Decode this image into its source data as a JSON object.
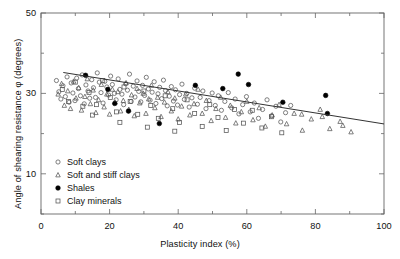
{
  "chart_data": {
    "type": "scatter",
    "title": "",
    "xlabel": "Plasticity index (%)",
    "ylabel": "Angle of shearing resistance φ (degrees)",
    "xlim": [
      0,
      100
    ],
    "ylim": [
      0,
      50
    ],
    "xticks": [
      0,
      20,
      40,
      60,
      80,
      100
    ],
    "yticks": [
      10,
      30,
      50
    ],
    "xminor_step": 10,
    "yminor_step": 10,
    "grid": false,
    "legend_position": "lower-left-inside",
    "series": [
      {
        "name": "Soft clays",
        "marker": "open-circle",
        "color": "#555555",
        "points": [
          [
            4.5,
            33.2
          ],
          [
            5.2,
            30.4
          ],
          [
            5.8,
            28.6
          ],
          [
            6.4,
            31.9
          ],
          [
            7.1,
            29.2
          ],
          [
            7.6,
            34.1
          ],
          [
            8.2,
            27.8
          ],
          [
            8.8,
            32.6
          ],
          [
            9.3,
            30.1
          ],
          [
            9.9,
            28.2
          ],
          [
            10.4,
            33.8
          ],
          [
            10.9,
            31.2
          ],
          [
            11.5,
            29.4
          ],
          [
            12.0,
            34.6
          ],
          [
            12.6,
            27.4
          ],
          [
            13.1,
            32.1
          ],
          [
            13.7,
            30.6
          ],
          [
            14.2,
            28.8
          ],
          [
            14.8,
            33.4
          ],
          [
            15.3,
            31.4
          ],
          [
            15.9,
            29.0
          ],
          [
            16.4,
            35.1
          ],
          [
            17.0,
            32.8
          ],
          [
            17.5,
            30.2
          ],
          [
            18.1,
            27.6
          ],
          [
            18.6,
            33.0
          ],
          [
            19.2,
            31.6
          ],
          [
            19.7,
            29.6
          ],
          [
            20.3,
            34.3
          ],
          [
            20.8,
            32.2
          ],
          [
            21.4,
            30.0
          ],
          [
            21.9,
            28.4
          ],
          [
            22.5,
            33.6
          ],
          [
            23.0,
            31.0
          ],
          [
            23.6,
            29.8
          ],
          [
            24.1,
            27.2
          ],
          [
            24.7,
            32.4
          ],
          [
            25.2,
            30.8
          ],
          [
            25.8,
            34.8
          ],
          [
            26.3,
            28.0
          ],
          [
            26.9,
            31.8
          ],
          [
            27.4,
            29.1
          ],
          [
            28.0,
            33.1
          ],
          [
            28.5,
            30.5
          ],
          [
            29.1,
            27.9
          ],
          [
            29.6,
            32.0
          ],
          [
            30.2,
            29.5
          ],
          [
            30.7,
            34.0
          ],
          [
            31.3,
            31.1
          ],
          [
            31.8,
            28.3
          ],
          [
            32.4,
            30.3
          ],
          [
            33.0,
            32.9
          ],
          [
            33.5,
            27.5
          ],
          [
            34.1,
            29.9
          ],
          [
            34.6,
            31.5
          ],
          [
            35.2,
            28.7
          ],
          [
            35.7,
            33.3
          ],
          [
            36.3,
            30.7
          ],
          [
            36.8,
            26.9
          ],
          [
            37.4,
            29.3
          ],
          [
            38.0,
            31.7
          ],
          [
            38.6,
            28.1
          ],
          [
            39.2,
            30.9
          ],
          [
            39.8,
            27.1
          ],
          [
            40.4,
            29.7
          ],
          [
            41.1,
            32.3
          ],
          [
            41.8,
            28.5
          ],
          [
            42.5,
            30.0
          ],
          [
            43.2,
            26.6
          ],
          [
            44.0,
            28.9
          ],
          [
            44.8,
            31.3
          ],
          [
            45.6,
            27.3
          ],
          [
            46.4,
            29.0
          ],
          [
            47.2,
            30.6
          ],
          [
            48.1,
            26.2
          ],
          [
            49.0,
            28.2
          ],
          [
            49.9,
            30.1
          ],
          [
            50.8,
            27.0
          ],
          [
            51.7,
            29.4
          ],
          [
            52.6,
            25.8
          ],
          [
            53.6,
            28.0
          ],
          [
            54.6,
            30.2
          ],
          [
            55.6,
            26.4
          ],
          [
            56.6,
            28.6
          ],
          [
            57.7,
            24.9
          ],
          [
            58.8,
            27.2
          ],
          [
            59.9,
            29.2
          ],
          [
            61.0,
            25.4
          ],
          [
            62.2,
            27.6
          ],
          [
            63.4,
            23.8
          ],
          [
            64.6,
            26.0
          ],
          [
            65.9,
            28.4
          ],
          [
            67.2,
            24.4
          ],
          [
            68.5,
            26.8
          ],
          [
            69.9,
            22.9
          ],
          [
            71.3,
            25.2
          ],
          [
            72.8,
            27.0
          ]
        ]
      },
      {
        "name": "Soft and stiff clays",
        "marker": "open-triangle",
        "color": "#555555",
        "points": [
          [
            5.0,
            29.8
          ],
          [
            6.0,
            32.4
          ],
          [
            6.8,
            27.0
          ],
          [
            7.8,
            30.6
          ],
          [
            8.6,
            26.2
          ],
          [
            9.5,
            33.0
          ],
          [
            10.2,
            28.8
          ],
          [
            11.0,
            31.4
          ],
          [
            11.8,
            25.8
          ],
          [
            12.8,
            29.2
          ],
          [
            13.5,
            33.6
          ],
          [
            14.4,
            27.4
          ],
          [
            15.2,
            30.8
          ],
          [
            16.0,
            25.2
          ],
          [
            16.8,
            28.4
          ],
          [
            17.6,
            32.2
          ],
          [
            18.4,
            26.6
          ],
          [
            19.2,
            29.8
          ],
          [
            20.0,
            24.8
          ],
          [
            20.8,
            31.0
          ],
          [
            21.6,
            27.8
          ],
          [
            22.4,
            30.4
          ],
          [
            23.2,
            25.6
          ],
          [
            24.0,
            28.2
          ],
          [
            24.8,
            32.6
          ],
          [
            25.6,
            26.0
          ],
          [
            26.4,
            29.6
          ],
          [
            27.2,
            24.4
          ],
          [
            28.0,
            31.2
          ],
          [
            28.8,
            27.6
          ],
          [
            29.8,
            30.0
          ],
          [
            30.6,
            25.0
          ],
          [
            31.4,
            28.6
          ],
          [
            32.2,
            32.0
          ],
          [
            33.2,
            26.4
          ],
          [
            34.0,
            29.0
          ],
          [
            35.0,
            24.2
          ],
          [
            36.0,
            27.8
          ],
          [
            37.0,
            30.4
          ],
          [
            38.0,
            25.6
          ],
          [
            39.0,
            28.8
          ],
          [
            40.0,
            23.6
          ],
          [
            41.0,
            26.8
          ],
          [
            42.2,
            29.8
          ],
          [
            43.4,
            24.6
          ],
          [
            44.6,
            27.4
          ],
          [
            45.8,
            31.0
          ],
          [
            47.0,
            25.0
          ],
          [
            48.2,
            28.2
          ],
          [
            49.6,
            23.2
          ],
          [
            51.0,
            26.2
          ],
          [
            52.4,
            29.0
          ],
          [
            53.8,
            24.0
          ],
          [
            55.2,
            27.0
          ],
          [
            56.8,
            22.6
          ],
          [
            58.4,
            25.4
          ],
          [
            60.0,
            28.0
          ],
          [
            61.8,
            23.4
          ],
          [
            63.6,
            26.4
          ],
          [
            65.4,
            21.8
          ],
          [
            67.4,
            24.6
          ],
          [
            69.4,
            27.2
          ],
          [
            71.6,
            22.4
          ],
          [
            73.8,
            25.0
          ],
          [
            76.2,
            20.8
          ],
          [
            78.8,
            23.6
          ],
          [
            81.4,
            26.0
          ],
          [
            84.2,
            21.2
          ],
          [
            87.2,
            23.0
          ],
          [
            90.4,
            20.4
          ],
          [
            76.0,
            24.8
          ],
          [
            82.0,
            24.2
          ],
          [
            88.0,
            22.0
          ]
        ]
      },
      {
        "name": "Shales",
        "marker": "filled-circle",
        "color": "#000000",
        "points": [
          [
            13.0,
            34.5
          ],
          [
            19.5,
            31.0
          ],
          [
            21.5,
            27.5
          ],
          [
            25.5,
            25.6
          ],
          [
            34.5,
            22.5
          ],
          [
            45.0,
            32.0
          ],
          [
            53.0,
            31.2
          ],
          [
            57.5,
            34.8
          ],
          [
            60.5,
            32.2
          ],
          [
            70.5,
            27.8
          ],
          [
            83.0,
            29.5
          ],
          [
            83.5,
            25.0
          ]
        ]
      },
      {
        "name": "Clay minerals",
        "marker": "open-square",
        "color": "#555555",
        "points": [
          [
            6.2,
            31.0
          ],
          [
            8.0,
            28.0
          ],
          [
            10.0,
            32.8
          ],
          [
            12.2,
            26.8
          ],
          [
            14.0,
            30.2
          ],
          [
            16.2,
            27.2
          ],
          [
            18.0,
            33.2
          ],
          [
            20.2,
            29.0
          ],
          [
            22.0,
            25.4
          ],
          [
            24.2,
            31.6
          ],
          [
            26.0,
            28.0
          ],
          [
            28.2,
            24.8
          ],
          [
            30.0,
            30.6
          ],
          [
            32.0,
            27.0
          ],
          [
            34.2,
            23.8
          ],
          [
            36.2,
            29.4
          ],
          [
            38.4,
            26.2
          ],
          [
            40.4,
            22.8
          ],
          [
            42.6,
            28.4
          ],
          [
            44.8,
            25.0
          ],
          [
            47.0,
            21.8
          ],
          [
            49.2,
            27.2
          ],
          [
            51.6,
            24.0
          ],
          [
            54.0,
            20.8
          ],
          [
            56.4,
            26.0
          ],
          [
            59.0,
            22.6
          ],
          [
            61.6,
            25.8
          ],
          [
            64.4,
            21.4
          ],
          [
            67.2,
            24.2
          ],
          [
            70.2,
            20.2
          ],
          [
            15.0,
            24.6
          ],
          [
            23.0,
            22.8
          ],
          [
            31.0,
            21.6
          ],
          [
            39.0,
            20.6
          ]
        ]
      }
    ],
    "trendline": {
      "name": "fitted trend",
      "color": "#333333",
      "x_start": 6.5,
      "y_start": 35.2,
      "x_end": 100,
      "y_end": 22.4
    }
  },
  "legend": {
    "items": [
      {
        "label": "Soft clays",
        "marker": "open-circle"
      },
      {
        "label": "Soft and stiff clays",
        "marker": "open-triangle"
      },
      {
        "label": "Shales",
        "marker": "filled-circle"
      },
      {
        "label": "Clay minerals",
        "marker": "open-square"
      }
    ]
  },
  "axes": {
    "x_tick_labels": [
      "0",
      "20",
      "40",
      "60",
      "80",
      "100"
    ],
    "y_tick_labels": [
      "10",
      "30",
      "50"
    ]
  }
}
